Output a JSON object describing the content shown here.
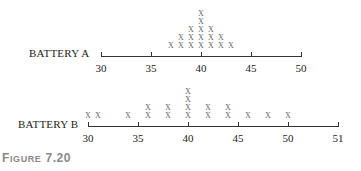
{
  "caption": {
    "prefix_big": "F",
    "prefix_small": "IGURE",
    "number": "7.20"
  },
  "chart_data": [
    {
      "type": "dot",
      "title": "BATTERY A",
      "xlabel": "",
      "ylabel": "",
      "xlim": [
        30,
        50
      ],
      "ticks": [
        30,
        35,
        40,
        45,
        50
      ],
      "tick_labels": [
        "30",
        "35",
        "40",
        "45",
        "50"
      ],
      "points": [
        {
          "x": 37,
          "count": 1
        },
        {
          "x": 38,
          "count": 2
        },
        {
          "x": 39,
          "count": 3
        },
        {
          "x": 40,
          "count": 5
        },
        {
          "x": 41,
          "count": 3
        },
        {
          "x": 42,
          "count": 2
        },
        {
          "x": 43,
          "count": 1
        }
      ],
      "marker": "X"
    },
    {
      "type": "dot",
      "title": "BATTERY B",
      "xlabel": "",
      "ylabel": "",
      "xlim": [
        30,
        51
      ],
      "ticks": [
        30,
        35,
        40,
        45,
        50,
        51
      ],
      "tick_labels": [
        "30",
        "35",
        "40",
        "45",
        "50",
        "51"
      ],
      "points": [
        {
          "x": 30,
          "count": 1
        },
        {
          "x": 31,
          "count": 1
        },
        {
          "x": 34,
          "count": 1
        },
        {
          "x": 36,
          "count": 2
        },
        {
          "x": 38,
          "count": 2
        },
        {
          "x": 40,
          "count": 4
        },
        {
          "x": 42,
          "count": 2
        },
        {
          "x": 44,
          "count": 2
        },
        {
          "x": 46,
          "count": 1
        },
        {
          "x": 48,
          "count": 1
        },
        {
          "x": 50,
          "count": 1
        }
      ],
      "marker": "X"
    }
  ]
}
